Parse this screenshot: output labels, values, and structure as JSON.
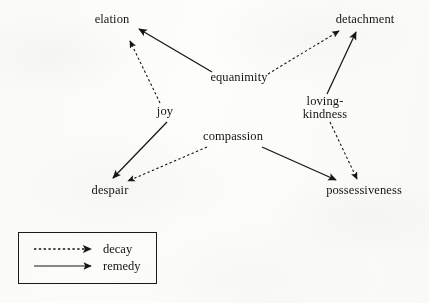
{
  "diagram": {
    "ink_color": "#151515",
    "background_color": "#fdfdfc",
    "nodes": [
      {
        "id": "elation",
        "label": "elation",
        "x": 112,
        "y": 20,
        "role": "outcome"
      },
      {
        "id": "detachment",
        "label": "detachment",
        "x": 365,
        "y": 20,
        "role": "outcome"
      },
      {
        "id": "equanimity",
        "label": "equanimity",
        "x": 239,
        "y": 78,
        "role": "source"
      },
      {
        "id": "loving-kindness",
        "label": "loving-\nkindness",
        "x": 325,
        "y": 108,
        "role": "source"
      },
      {
        "id": "joy",
        "label": "joy",
        "x": 165,
        "y": 112,
        "role": "source"
      },
      {
        "id": "compassion",
        "label": "compassion",
        "x": 233,
        "y": 137,
        "role": "source"
      },
      {
        "id": "despair",
        "label": "despair",
        "x": 110,
        "y": 191,
        "role": "outcome"
      },
      {
        "id": "possessiveness",
        "label": "possessiveness",
        "x": 364,
        "y": 191,
        "role": "outcome"
      }
    ],
    "edges": [
      {
        "from": "equanimity",
        "to": "elation",
        "type": "remedy"
      },
      {
        "from": "joy",
        "to": "elation",
        "type": "decay"
      },
      {
        "from": "equanimity",
        "to": "detachment",
        "type": "decay"
      },
      {
        "from": "loving-kindness",
        "to": "detachment",
        "type": "remedy"
      },
      {
        "from": "joy",
        "to": "despair",
        "type": "remedy"
      },
      {
        "from": "compassion",
        "to": "despair",
        "type": "decay"
      },
      {
        "from": "compassion",
        "to": "possessiveness",
        "type": "remedy"
      },
      {
        "from": "loving-kindness",
        "to": "possessiveness",
        "type": "decay"
      }
    ]
  },
  "legend": {
    "decay_label": "decay",
    "remedy_label": "remedy"
  }
}
